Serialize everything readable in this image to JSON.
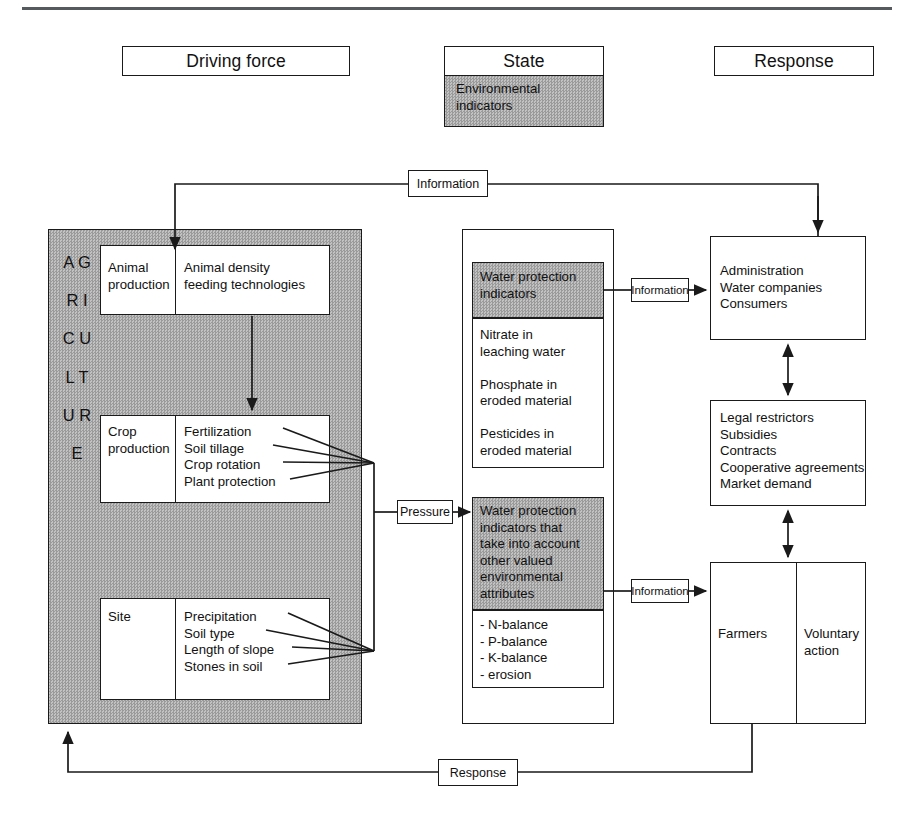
{
  "headers": {
    "driving_force": "Driving force",
    "state": "State",
    "response": "Response",
    "state_sub": "Environmental\nindicators"
  },
  "agriculture": {
    "vertical_word": "A\nG\nR\nI\nC\nU\nL\nT\nU\nR\nE",
    "rows": [
      {
        "name": "animal-production",
        "left": "Animal\nproduction",
        "right": "Animal density\nfeeding technologies"
      },
      {
        "name": "crop-production",
        "left": "Crop\nproduction",
        "right": "Fertilization\nSoil tillage\nCrop rotation\nPlant protection"
      },
      {
        "name": "site",
        "left": "Site",
        "right": "Precipitation\nSoil type\nLength of slope\nStones in soil"
      }
    ]
  },
  "state_column": {
    "upper": {
      "header": "Water protection\nindicators",
      "body": "Nitrate in\nleaching water\n\nPhosphate in\neroded material\n\nPesticides in\neroded material"
    },
    "lower": {
      "header": "Water protection\nindicators that\ntake into account\nother valued\nenvironmental\nattributes",
      "body": "- N-balance\n- P-balance\n- K-balance\n- erosion"
    }
  },
  "response_column": {
    "actors": "Administration\nWater companies\nConsumers",
    "instruments": "Legal restrictors\nSubsidies\nContracts\nCooperative agreements\nMarket demand",
    "farmers": "Farmers",
    "voluntary_action": "Voluntary\naction"
  },
  "flow_labels": {
    "information_top": "Information",
    "pressure": "Pressure",
    "information_upper": "Information",
    "information_lower": "Information",
    "response_bottom": "Response"
  },
  "colors": {
    "ink": "#1a1a1a",
    "gray_fill": "#a8a8a8",
    "rule": "#555a5e",
    "page": "#ffffff"
  }
}
